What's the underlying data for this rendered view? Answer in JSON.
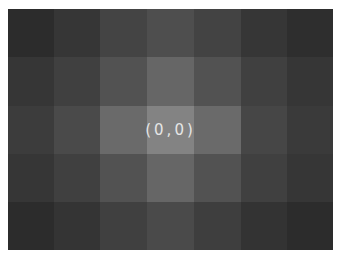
{
  "grid": {
    "columns": 7,
    "rows": 5,
    "center_label": "(0,0)",
    "label_color": "#e6e6e6",
    "cells": [
      [
        "#2c2c2c",
        "#363636",
        "#444444",
        "#4e4e4e",
        "#434343",
        "#363636",
        "#2e2e2e"
      ],
      [
        "#363636",
        "#404040",
        "#525252",
        "#666666",
        "#525252",
        "#404040",
        "#363636"
      ],
      [
        "#3c3c3c",
        "#4a4a4a",
        "#6a6a6a",
        "#838383",
        "#6a6a6a",
        "#464646",
        "#3a3a3a"
      ],
      [
        "#363636",
        "#404040",
        "#525252",
        "#666666",
        "#525252",
        "#404040",
        "#363636"
      ],
      [
        "#2c2c2c",
        "#343434",
        "#404040",
        "#4a4a4a",
        "#3e3e3e",
        "#333333",
        "#2c2c2c"
      ]
    ]
  }
}
